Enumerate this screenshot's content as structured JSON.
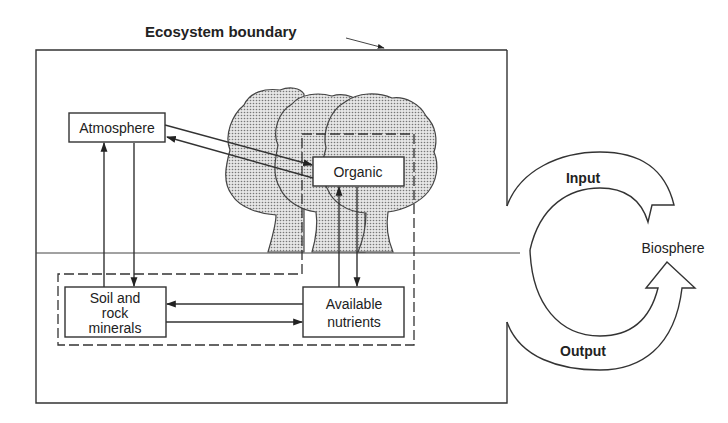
{
  "title": "Ecosystem boundary",
  "compartments": {
    "atmosphere": "Atmosphere",
    "organic": "Organic",
    "soil": [
      "Soil and",
      "rock",
      "minerals"
    ],
    "nutrients": [
      "Available",
      "nutrients"
    ]
  },
  "biosphere": {
    "label": "Biosphere",
    "input": "Input",
    "output": "Output"
  },
  "flows": [
    {
      "from": "Atmosphere",
      "to": "Organic"
    },
    {
      "from": "Organic",
      "to": "Atmosphere"
    },
    {
      "from": "Soil and rock minerals",
      "to": "Atmosphere"
    },
    {
      "from": "Atmosphere",
      "to": "Soil and rock minerals"
    },
    {
      "from": "Available nutrients",
      "to": "Organic"
    },
    {
      "from": "Organic",
      "to": "Available nutrients"
    },
    {
      "from": "Available nutrients",
      "to": "Soil and rock minerals"
    },
    {
      "from": "Soil and rock minerals",
      "to": "Available nutrients"
    },
    {
      "from": "Biosphere",
      "to": "Ecosystem",
      "label": "Input"
    },
    {
      "from": "Ecosystem",
      "to": "Biosphere",
      "label": "Output"
    }
  ],
  "colors": {
    "ink": "#333333",
    "background": "#ffffff",
    "stipple": "#888888"
  }
}
